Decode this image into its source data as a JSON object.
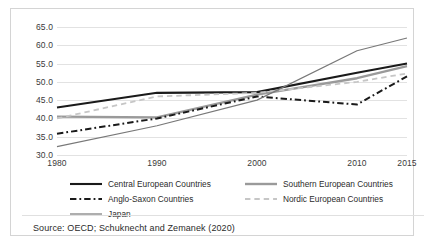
{
  "chart_data": {
    "type": "line",
    "title": "",
    "subtitle": "",
    "xlabel": "",
    "ylabel": "",
    "x": [
      1980,
      1990,
      2000,
      2010,
      2015
    ],
    "xlim": [
      1980,
      2015
    ],
    "ylim": [
      30.0,
      65.0
    ],
    "xticks": [
      "1980",
      "1990",
      "2000",
      "2010",
      "2015"
    ],
    "yticks": [
      "30.0",
      "35.0",
      "40.0",
      "45.0",
      "50.0",
      "55.0",
      "60.0",
      "65.0"
    ],
    "grid": "horizontal",
    "legend_position": "bottom",
    "series": [
      {
        "name": "Central European Countries",
        "values": [
          43.0,
          47.0,
          47.2,
          52.5,
          55.0
        ],
        "color": "#1a1a1a",
        "style": "solid",
        "width": 2.1
      },
      {
        "name": "Southern European Countries",
        "values": [
          40.5,
          40.3,
          46.5,
          51.0,
          54.3
        ],
        "color": "#9a9a9a",
        "style": "solid",
        "width": 2.4
      },
      {
        "name": "Anglo-Saxon Countries",
        "values": [
          35.8,
          40.0,
          46.0,
          43.8,
          51.5
        ],
        "color": "#1a1a1a",
        "style": "dashdot",
        "width": 2.0
      },
      {
        "name": "Nordic European Countries",
        "values": [
          40.0,
          46.0,
          47.0,
          50.0,
          52.3
        ],
        "color": "#c6c6c6",
        "style": "dashed",
        "width": 1.8
      },
      {
        "name": "Japan",
        "values": [
          32.3,
          38.0,
          45.0,
          58.5,
          62.0
        ],
        "color": "#787878",
        "style": "solid",
        "width": 1.2
      }
    ]
  },
  "legend": {
    "items": [
      {
        "label": "Central European Countries"
      },
      {
        "label": "Southern European Countries"
      },
      {
        "label": "Anglo-Saxon Countries"
      },
      {
        "label": "Nordic European Countries"
      },
      {
        "label": "Japan"
      }
    ]
  },
  "footer": {
    "source": "Source: OECD; Schuknecht and Zemanek (2020)"
  }
}
